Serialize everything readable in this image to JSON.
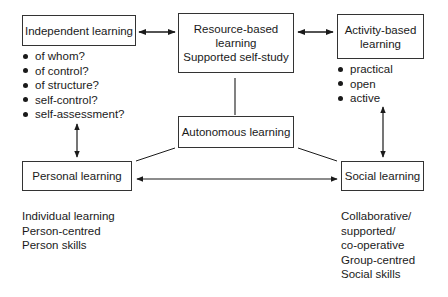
{
  "nodes": {
    "independent": {
      "label": "Independent learning"
    },
    "resource": {
      "lines": [
        "Resource-based",
        "learning",
        "Supported self-study"
      ]
    },
    "activity": {
      "lines": [
        "Activity-based",
        "learning"
      ]
    },
    "autonomous": {
      "label": "Autonomous learning"
    },
    "personal": {
      "label": "Personal learning"
    },
    "social": {
      "label": "Social learning"
    }
  },
  "independent_bullets": [
    "of whom?",
    "of control?",
    "of structure?",
    "self-control?",
    "self-assessment?"
  ],
  "activity_bullets": [
    "practical",
    "open",
    "active"
  ],
  "personal_notes": [
    "Individual learning",
    "Person-centred",
    "Person skills"
  ],
  "social_notes": [
    "Collaborative/",
    "supported/",
    "co-operative",
    "Group-centred",
    "Social skills"
  ],
  "colors": {
    "line": "#1a1a1a",
    "background": "#ffffff"
  }
}
